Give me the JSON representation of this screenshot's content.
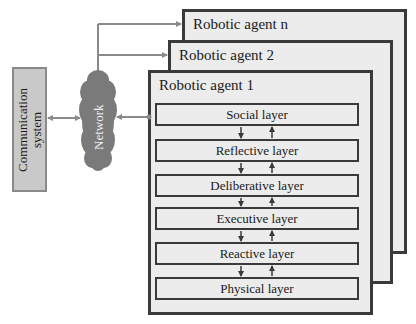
{
  "diagram": {
    "communication_system": {
      "label_line1": "Communication",
      "label_line2": "system"
    },
    "network": {
      "label": "Network"
    },
    "agents": [
      {
        "title": "Robotic agent n"
      },
      {
        "title": "Robotic agent 2"
      },
      {
        "title": "Robotic agent 1"
      }
    ],
    "layers": [
      {
        "label": "Social layer"
      },
      {
        "label": "Reflective layer"
      },
      {
        "label": "Deliberative layer"
      },
      {
        "label": "Executive layer"
      },
      {
        "label": "Reactive layer"
      },
      {
        "label": "Physical layer"
      }
    ],
    "colors": {
      "box_fill": "#ececec",
      "border": "#3a3a3a",
      "comm_fill": "#c9c9c9",
      "network_fill": "#7a7a7a",
      "connector": "#8a8a8a"
    }
  }
}
